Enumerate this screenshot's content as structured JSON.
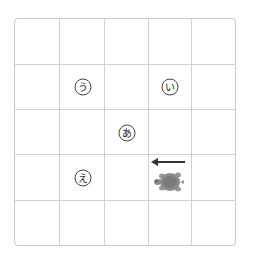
{
  "grid": {
    "rows": 5,
    "cols": 5
  },
  "labels": {
    "a": {
      "text": "あ",
      "row": 2,
      "col": 2
    },
    "i": {
      "text": "い",
      "row": 1,
      "col": 3
    },
    "u": {
      "text": "う",
      "row": 1,
      "col": 1
    },
    "e": {
      "text": "え",
      "row": 3,
      "col": 1
    }
  },
  "turtle": {
    "row": 3,
    "col": 3,
    "facing": "left",
    "color": "#8a8a8a"
  },
  "arrow": {
    "direction": "left",
    "color": "#333333"
  }
}
